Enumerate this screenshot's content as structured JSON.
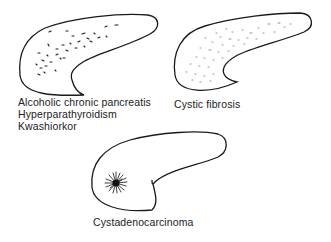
{
  "diagram": {
    "panels": [
      {
        "id": "panel-1",
        "pattern": "coarse scattered calcifications",
        "labels": [
          "Alcoholic chronic pancreatis",
          "Hyperparathyroidism",
          "Kwashiorkor"
        ]
      },
      {
        "id": "panel-2",
        "pattern": "fine diffuse stippled calcifications",
        "labels": [
          "Cystic fibrosis"
        ]
      },
      {
        "id": "panel-3",
        "pattern": "sunburst central calcification in head",
        "labels": [
          "Cystadenocarcinoma"
        ]
      }
    ],
    "colors": {
      "outline": "#1a1a1a",
      "text": "#222222",
      "background": "#ffffff"
    }
  }
}
